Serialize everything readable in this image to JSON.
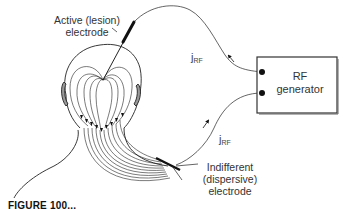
{
  "figure": {
    "caption_visible": "FIGURE 100..."
  },
  "labels": {
    "active_electrode_line1": "Active (lesion)",
    "active_electrode_line2": "electrode",
    "generator_line1": "RF",
    "generator_line2": "generator",
    "current_symbol": "j",
    "current_subscript": "RF",
    "indifferent_line1": "Indifferent",
    "indifferent_line2": "(dispersive)",
    "indifferent_line3": "electrode"
  },
  "colors": {
    "line": "#222222",
    "text": "#333333",
    "background": "#ffffff",
    "box_border": "#333333"
  },
  "components": [
    {
      "name": "head-and-neck-outline",
      "type": "anatomy"
    },
    {
      "name": "active-electrode",
      "type": "needle electrode"
    },
    {
      "name": "rf-generator",
      "type": "box with two terminals"
    },
    {
      "name": "dispersive-electrode",
      "type": "pad electrode on shoulder"
    },
    {
      "name": "current-field-lines",
      "type": "curved lines with arrowheads"
    }
  ]
}
